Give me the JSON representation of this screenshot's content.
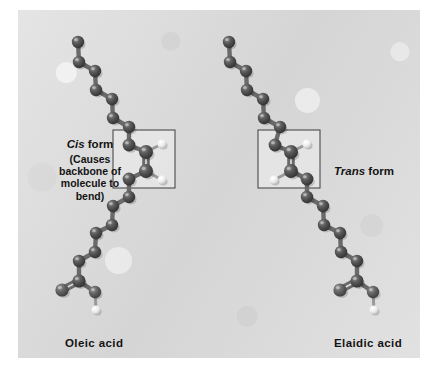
{
  "figure": {
    "background_color": "#d9d9d9",
    "page_color": "#ffffff",
    "panel": {
      "x": 18,
      "y": 10,
      "width": 402,
      "height": 348
    }
  },
  "labels": {
    "cis": {
      "emphasis": "Cis",
      "rest": " form",
      "note": "(Causes backbone of molecule to bend)"
    },
    "trans": {
      "emphasis": "Trans",
      "rest": " form"
    },
    "oleic": "Oleic acid",
    "elaidic": "Elaidic acid"
  },
  "colors": {
    "carbon": "#4a4a4a",
    "carbon_highlight": "#8f8f8f",
    "oxygen": "#5a5a5a",
    "hydrogen": "#f2f2f2",
    "bond": "#6a6a6a",
    "box_stroke": "#3d3d3d",
    "box_fill": "#e6e6e6",
    "text": "#141414"
  },
  "molecules": [
    {
      "name": "oleic-acid",
      "label": "Oleic acid",
      "configuration": "cis",
      "box": {
        "x": 113,
        "y": 130,
        "width": 62,
        "height": 58
      },
      "atoms": [
        {
          "id": "c18",
          "el": "C",
          "x": 78,
          "y": 42,
          "r": 6.2
        },
        {
          "id": "c17",
          "el": "C",
          "x": 79,
          "y": 62,
          "r": 6.2
        },
        {
          "id": "c16",
          "el": "C",
          "x": 95,
          "y": 71,
          "r": 6.2
        },
        {
          "id": "c15",
          "el": "C",
          "x": 96,
          "y": 90,
          "r": 6.2
        },
        {
          "id": "c14",
          "el": "C",
          "x": 112,
          "y": 99,
          "r": 6.2
        },
        {
          "id": "c13",
          "el": "C",
          "x": 113,
          "y": 118,
          "r": 6.2
        },
        {
          "id": "c12",
          "el": "C",
          "x": 129,
          "y": 127,
          "r": 6.2
        },
        {
          "id": "c11",
          "el": "C",
          "x": 129,
          "y": 145,
          "r": 6.4
        },
        {
          "id": "c10",
          "el": "C",
          "x": 146,
          "y": 152,
          "r": 7.0
        },
        {
          "id": "h10",
          "el": "H",
          "x": 162,
          "y": 144,
          "r": 4.6
        },
        {
          "id": "c9",
          "el": "C",
          "x": 146,
          "y": 171,
          "r": 7.0
        },
        {
          "id": "h9",
          "el": "H",
          "x": 162,
          "y": 180,
          "r": 4.6
        },
        {
          "id": "c8",
          "el": "C",
          "x": 129,
          "y": 179,
          "r": 6.4
        },
        {
          "id": "c7",
          "el": "C",
          "x": 129,
          "y": 197,
          "r": 6.2
        },
        {
          "id": "c6",
          "el": "C",
          "x": 113,
          "y": 206,
          "r": 6.2
        },
        {
          "id": "c5",
          "el": "C",
          "x": 112,
          "y": 225,
          "r": 6.2
        },
        {
          "id": "c4",
          "el": "C",
          "x": 96,
          "y": 233,
          "r": 6.2
        },
        {
          "id": "c3",
          "el": "C",
          "x": 95,
          "y": 252,
          "r": 6.2
        },
        {
          "id": "c2",
          "el": "C",
          "x": 79,
          "y": 261,
          "r": 6.2
        },
        {
          "id": "c1",
          "el": "C",
          "x": 79,
          "y": 281,
          "r": 6.6
        },
        {
          "id": "o1",
          "el": "O",
          "x": 62,
          "y": 290,
          "r": 6.6
        },
        {
          "id": "o2",
          "el": "O",
          "x": 95,
          "y": 292,
          "r": 6.2
        },
        {
          "id": "ho",
          "el": "H",
          "x": 96,
          "y": 310,
          "r": 4.6
        }
      ],
      "bonds": [
        {
          "a": "c18",
          "b": "c17",
          "order": 1
        },
        {
          "a": "c17",
          "b": "c16",
          "order": 1
        },
        {
          "a": "c16",
          "b": "c15",
          "order": 1
        },
        {
          "a": "c15",
          "b": "c14",
          "order": 1
        },
        {
          "a": "c14",
          "b": "c13",
          "order": 1
        },
        {
          "a": "c13",
          "b": "c12",
          "order": 1
        },
        {
          "a": "c12",
          "b": "c11",
          "order": 1
        },
        {
          "a": "c11",
          "b": "c10",
          "order": 1
        },
        {
          "a": "c10",
          "b": "h10",
          "order": 1
        },
        {
          "a": "c10",
          "b": "c9",
          "order": 2
        },
        {
          "a": "c9",
          "b": "h9",
          "order": 1
        },
        {
          "a": "c9",
          "b": "c8",
          "order": 1
        },
        {
          "a": "c8",
          "b": "c7",
          "order": 1
        },
        {
          "a": "c7",
          "b": "c6",
          "order": 1
        },
        {
          "a": "c6",
          "b": "c5",
          "order": 1
        },
        {
          "a": "c5",
          "b": "c4",
          "order": 1
        },
        {
          "a": "c4",
          "b": "c3",
          "order": 1
        },
        {
          "a": "c3",
          "b": "c2",
          "order": 1
        },
        {
          "a": "c2",
          "b": "c1",
          "order": 1
        },
        {
          "a": "c1",
          "b": "o1",
          "order": 2
        },
        {
          "a": "c1",
          "b": "o2",
          "order": 1
        },
        {
          "a": "o2",
          "b": "ho",
          "order": 1
        }
      ]
    },
    {
      "name": "elaidic-acid",
      "label": "Elaidic acid",
      "configuration": "trans",
      "box": {
        "x": 258,
        "y": 130,
        "width": 62,
        "height": 58
      },
      "atoms": [
        {
          "id": "c18",
          "el": "C",
          "x": 229,
          "y": 42,
          "r": 6.2
        },
        {
          "id": "c17",
          "el": "C",
          "x": 230,
          "y": 62,
          "r": 6.2
        },
        {
          "id": "c16",
          "el": "C",
          "x": 246,
          "y": 71,
          "r": 6.2
        },
        {
          "id": "c15",
          "el": "C",
          "x": 247,
          "y": 90,
          "r": 6.2
        },
        {
          "id": "c14",
          "el": "C",
          "x": 263,
          "y": 99,
          "r": 6.2
        },
        {
          "id": "c13",
          "el": "C",
          "x": 264,
          "y": 118,
          "r": 6.2
        },
        {
          "id": "c12",
          "el": "C",
          "x": 280,
          "y": 127,
          "r": 6.2
        },
        {
          "id": "c11",
          "el": "C",
          "x": 275,
          "y": 145,
          "r": 6.4
        },
        {
          "id": "c10",
          "el": "C",
          "x": 291,
          "y": 152,
          "r": 7.0
        },
        {
          "id": "h10",
          "el": "H",
          "x": 307,
          "y": 144,
          "r": 4.6
        },
        {
          "id": "c9",
          "el": "C",
          "x": 291,
          "y": 171,
          "r": 7.0
        },
        {
          "id": "h9",
          "el": "H",
          "x": 274,
          "y": 180,
          "r": 4.6
        },
        {
          "id": "c8",
          "el": "C",
          "x": 307,
          "y": 179,
          "r": 6.4
        },
        {
          "id": "c7",
          "el": "C",
          "x": 307,
          "y": 197,
          "r": 6.2
        },
        {
          "id": "c6",
          "el": "C",
          "x": 323,
          "y": 206,
          "r": 6.2
        },
        {
          "id": "c5",
          "el": "C",
          "x": 324,
          "y": 225,
          "r": 6.2
        },
        {
          "id": "c4",
          "el": "C",
          "x": 340,
          "y": 233,
          "r": 6.2
        },
        {
          "id": "c3",
          "el": "C",
          "x": 341,
          "y": 252,
          "r": 6.2
        },
        {
          "id": "c2",
          "el": "C",
          "x": 357,
          "y": 261,
          "r": 6.2
        },
        {
          "id": "c1",
          "el": "C",
          "x": 357,
          "y": 281,
          "r": 6.6
        },
        {
          "id": "o1",
          "el": "O",
          "x": 340,
          "y": 290,
          "r": 6.6
        },
        {
          "id": "o2",
          "el": "O",
          "x": 373,
          "y": 292,
          "r": 6.2
        },
        {
          "id": "ho",
          "el": "H",
          "x": 374,
          "y": 310,
          "r": 4.6
        }
      ],
      "bonds": [
        {
          "a": "c18",
          "b": "c17",
          "order": 1
        },
        {
          "a": "c17",
          "b": "c16",
          "order": 1
        },
        {
          "a": "c16",
          "b": "c15",
          "order": 1
        },
        {
          "a": "c15",
          "b": "c14",
          "order": 1
        },
        {
          "a": "c14",
          "b": "c13",
          "order": 1
        },
        {
          "a": "c13",
          "b": "c12",
          "order": 1
        },
        {
          "a": "c12",
          "b": "c11",
          "order": 1
        },
        {
          "a": "c11",
          "b": "c10",
          "order": 1
        },
        {
          "a": "c10",
          "b": "h10",
          "order": 1
        },
        {
          "a": "c10",
          "b": "c9",
          "order": 2
        },
        {
          "a": "c9",
          "b": "h9",
          "order": 1
        },
        {
          "a": "c9",
          "b": "c8",
          "order": 1
        },
        {
          "a": "c8",
          "b": "c7",
          "order": 1
        },
        {
          "a": "c7",
          "b": "c6",
          "order": 1
        },
        {
          "a": "c6",
          "b": "c5",
          "order": 1
        },
        {
          "a": "c5",
          "b": "c4",
          "order": 1
        },
        {
          "a": "c4",
          "b": "c3",
          "order": 1
        },
        {
          "a": "c3",
          "b": "c2",
          "order": 1
        },
        {
          "a": "c2",
          "b": "c1",
          "order": 1
        },
        {
          "a": "c1",
          "b": "o1",
          "order": 2
        },
        {
          "a": "c1",
          "b": "o2",
          "order": 1
        },
        {
          "a": "o2",
          "b": "ho",
          "order": 1
        }
      ]
    }
  ]
}
